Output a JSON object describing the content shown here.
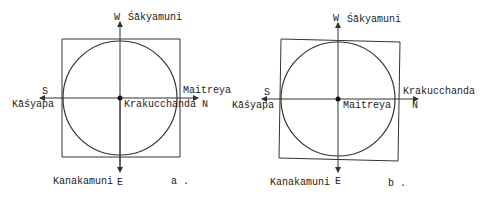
{
  "diagrams": [
    {
      "id": "a",
      "caption": "a .",
      "top_label": "Śākyamuni",
      "left_label": "Kāśyapa",
      "right_label": "Maitreya",
      "center_label": "Krakucchanda",
      "bottom_label": "Kanakamuni",
      "dir_top": "W",
      "dir_left": "S",
      "dir_right": "N",
      "dir_bottom": "E"
    },
    {
      "id": "b",
      "caption": "b .",
      "top_label": "Śākyamuni",
      "left_label": "Kāśyapa",
      "right_label": "Krakucchanda",
      "center_label": "Maitreya",
      "bottom_label": "Kanakamuni",
      "dir_top": "W",
      "dir_left": "S",
      "dir_right": "N",
      "dir_bottom": "E"
    }
  ],
  "colors": {
    "line": "#333333",
    "text": "#222222"
  }
}
